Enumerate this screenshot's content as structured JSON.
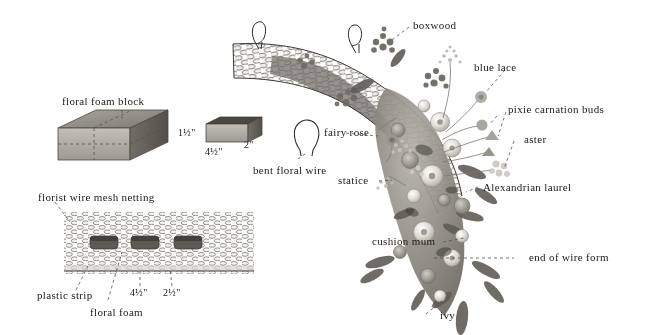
{
  "figure": {
    "medium": "grayscale pen-and-ink botanical illustration",
    "background_color": "#ffffff",
    "ink_color": "#23201e"
  },
  "labels": {
    "floral_foam_block": "floral foam block",
    "dim_height": "1½\"",
    "dim_length": "4½\"",
    "dim_depth": "2\"",
    "bent_floral_wire": "bent floral wire",
    "fairy_rose": "fairy rose",
    "boxwood": "boxwood",
    "blue_lace": "blue lace",
    "pixie_carnation_buds": "pixie carnation buds",
    "aster": "aster",
    "statice": "statice",
    "alexandrian_laurel": "Alexandrian laurel",
    "cushion_mum": "cushion mum",
    "end_of_wire_form": "end of wire form",
    "ivy": "ivy",
    "florist_wire_mesh_netting": "florist wire mesh netting",
    "plastic_strip": "plastic strip",
    "floral_foam": "floral foam",
    "mesh_dim_block": "4½\"",
    "mesh_dim_gap": "2½\""
  },
  "colors": {
    "ink": "#23201e",
    "leader": "#55504c",
    "foam_light": "#b9b6b0",
    "foam_mid": "#8e8a84",
    "foam_dark": "#5d5953",
    "mesh_line": "#6e6a64",
    "foliage_dark": "#6b6862",
    "foliage_mid": "#96938c",
    "foliage_light": "#c2bfb8",
    "bloom_light": "#d9d6d0",
    "bloom_pale": "#ebe9e4"
  }
}
